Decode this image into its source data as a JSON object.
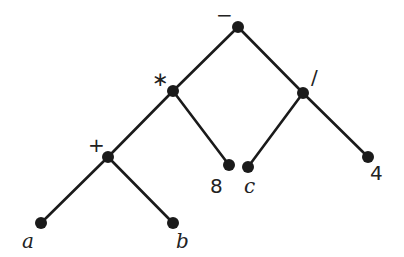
{
  "diagram": {
    "type": "expression-tree",
    "nodes": [
      {
        "id": "root",
        "label": "−",
        "kind": "op",
        "x": 238,
        "y": 27,
        "lx": 216,
        "ly": 22
      },
      {
        "id": "mul",
        "label": "∗",
        "kind": "op",
        "x": 173,
        "y": 91,
        "lx": 152,
        "ly": 86
      },
      {
        "id": "div",
        "label": "/",
        "kind": "op",
        "x": 303,
        "y": 93,
        "lx": 311,
        "ly": 84
      },
      {
        "id": "add",
        "label": "+",
        "kind": "op",
        "x": 108,
        "y": 157,
        "lx": 88,
        "ly": 152
      },
      {
        "id": "n8",
        "label": "8",
        "kind": "num",
        "x": 229,
        "y": 165,
        "lx": 210,
        "ly": 193
      },
      {
        "id": "c",
        "label": "c",
        "kind": "var",
        "x": 248,
        "y": 167,
        "lx": 244,
        "ly": 193
      },
      {
        "id": "n4",
        "label": "4",
        "kind": "num",
        "x": 368,
        "y": 157,
        "lx": 370,
        "ly": 180
      },
      {
        "id": "a",
        "label": "a",
        "kind": "var",
        "x": 41,
        "y": 223,
        "lx": 22,
        "ly": 248
      },
      {
        "id": "b",
        "label": "b",
        "kind": "var",
        "x": 173,
        "y": 223,
        "lx": 176,
        "ly": 248
      }
    ],
    "edges": [
      [
        "root",
        "mul"
      ],
      [
        "root",
        "div"
      ],
      [
        "mul",
        "add"
      ],
      [
        "mul",
        "n8"
      ],
      [
        "div",
        "c"
      ],
      [
        "div",
        "n4"
      ],
      [
        "add",
        "a"
      ],
      [
        "add",
        "b"
      ]
    ],
    "expression": "(a + b) * 8 - c / 4",
    "colors": {
      "stroke": "#1a1a1a",
      "background": "#ffffff"
    }
  }
}
